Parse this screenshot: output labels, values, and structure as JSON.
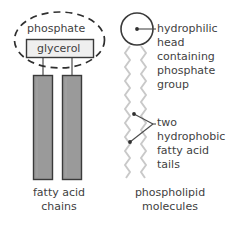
{
  "diagram": {
    "title_visible": false,
    "colors": {
      "stroke": "#3a3a3a",
      "text": "#3f3f3f",
      "bar_fill": "#9a9a9a",
      "box_fill": "#efefef",
      "tail_stroke": "#c9c9c9",
      "head_fill": "#ffffff",
      "background": "#ffffff"
    },
    "left_structure": {
      "name": "triglyceride-phospholipid-structure",
      "dashed_ellipse": {
        "name": "phosphate-group-outline",
        "cx": 59.5,
        "cy": 40,
        "rx": 45,
        "ry": 28,
        "style": "dashed"
      },
      "phosphate_label": "phosphate",
      "glycerol_box_label": "glycerol",
      "bars": [
        {
          "name": "fatty-acid-bar-left",
          "x": 33,
          "y": 75,
          "width": 20,
          "height": 105
        },
        {
          "name": "fatty-acid-bar-right",
          "x": 62,
          "y": 75,
          "width": 20,
          "height": 105
        }
      ],
      "caption_lines": [
        "fatty acid",
        "chains"
      ]
    },
    "right_structure": {
      "name": "phospholipid-molecule",
      "head": {
        "name": "hydrophilic-head-circle",
        "cx": 137,
        "cy": 29,
        "r": 16
      },
      "tails": [
        {
          "name": "fatty-acid-tail-left",
          "x": 130,
          "top": 46,
          "bottom": 178
        },
        {
          "name": "fatty-acid-tail-right",
          "x": 141,
          "top": 46,
          "bottom": 178
        }
      ],
      "caption_lines": [
        "phospholipid",
        "molecules"
      ]
    },
    "annotations": {
      "head_label_lines": [
        "hydrophilic",
        "head",
        "containing",
        "phosphate",
        "group"
      ],
      "tails_label_lines": [
        "two",
        "hydrophobic",
        "fatty acid",
        "tails"
      ]
    },
    "icons": {
      "leader_line": "leader-line-icon",
      "leader_dot": "leader-dot-icon",
      "zigzag": "zigzag-chain-icon"
    }
  }
}
